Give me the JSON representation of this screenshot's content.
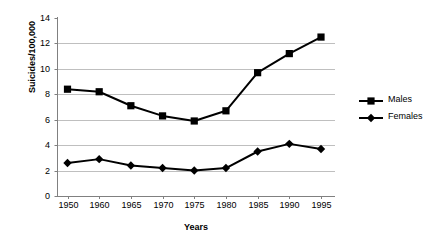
{
  "chart_data": {
    "type": "line",
    "title": "",
    "xlabel": "Years",
    "ylabel": "Suicides/100,000",
    "categories": [
      "1950",
      "1960",
      "1965",
      "1970",
      "1975",
      "1980",
      "1985",
      "1990",
      "1995"
    ],
    "series": [
      {
        "name": "Males",
        "marker": "square",
        "color": "#000000",
        "values": [
          8.4,
          8.2,
          7.1,
          6.3,
          5.9,
          6.7,
          9.7,
          11.2,
          12.5
        ]
      },
      {
        "name": "Females",
        "marker": "diamond",
        "color": "#000000",
        "values": [
          2.6,
          2.9,
          2.4,
          2.2,
          2.0,
          2.2,
          3.5,
          4.1,
          3.7
        ]
      }
    ],
    "ylim": [
      0,
      14
    ],
    "y_ticks": [
      "0",
      "2",
      "4",
      "6",
      "8",
      "10",
      "12",
      "14"
    ],
    "y_tick_values": [
      0,
      2,
      4,
      6,
      8,
      10,
      12,
      14
    ],
    "grid": "horizontal",
    "grid_color": "#BFBFBF",
    "axis_color": "#808080",
    "legend_position": "right"
  }
}
